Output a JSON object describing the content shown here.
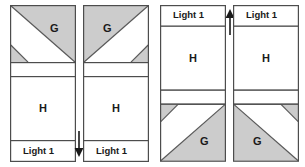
{
  "diagram": {
    "colors": {
      "fabric_g_fill": "#cccccc",
      "fabric_light_fill": "#ffffff",
      "outline": "#4d4d4d",
      "seam_line": "#595959",
      "text": "#1a1a1a",
      "background": "#ffffff"
    },
    "labels": {
      "g": "G",
      "h": "H",
      "light1": "Light 1"
    },
    "panels": [
      {
        "id": "panel-1",
        "name": "unit-a-left",
        "g_label": "G",
        "h_label": "H",
        "strip_label": "Light 1",
        "strip_position": "bottom",
        "g_orientation": "upper-right",
        "corner_triangle": "bottom-left"
      },
      {
        "id": "panel-2",
        "name": "unit-a-right",
        "g_label": "G",
        "h_label": "H",
        "strip_label": "Light 1",
        "strip_position": "bottom",
        "g_orientation": "upper-left",
        "corner_triangle": "bottom-right"
      },
      {
        "id": "panel-3",
        "name": "unit-b-left",
        "g_label": "G",
        "h_label": "H",
        "strip_label": "Light 1",
        "strip_position": "top",
        "g_orientation": "lower-right",
        "corner_triangle": "top-left"
      },
      {
        "id": "panel-4",
        "name": "unit-b-right",
        "g_label": "G",
        "h_label": "H",
        "strip_label": "Light 1",
        "strip_position": "top",
        "g_orientation": "lower-left",
        "corner_triangle": "top-right"
      }
    ],
    "arrows": [
      {
        "id": "arrow-down",
        "direction": "down",
        "glyph": "down-arrow"
      },
      {
        "id": "arrow-up",
        "direction": "up",
        "glyph": "up-arrow"
      }
    ]
  }
}
